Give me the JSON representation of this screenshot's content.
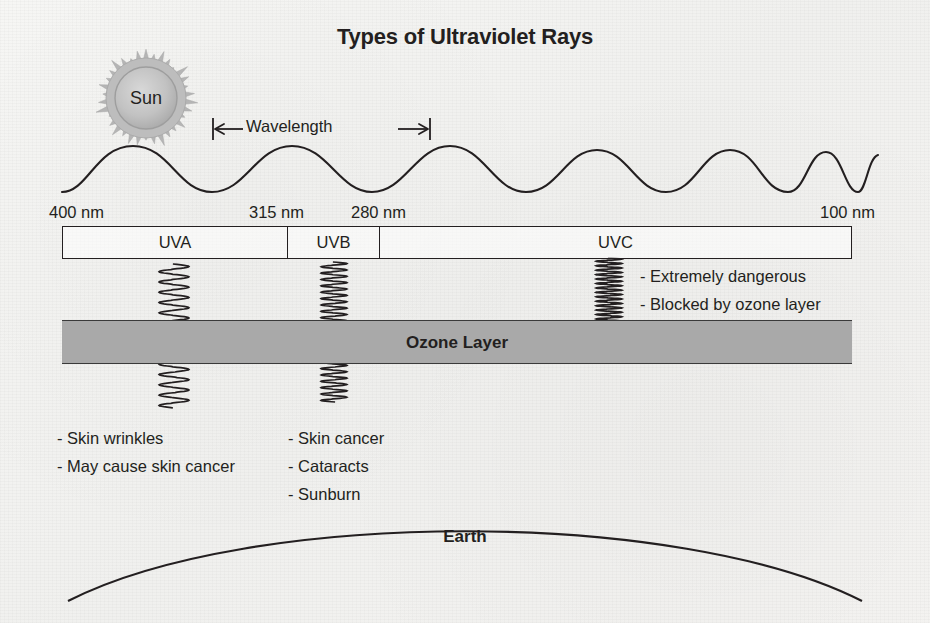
{
  "title": "Types of Ultraviolet Rays",
  "sun": {
    "label": "Sun",
    "icon": "sun-starburst-icon",
    "color": "#b3b3b3"
  },
  "wavelength_annotation": {
    "label": "Wavelength",
    "icon": "double-headed-arrow-icon"
  },
  "spectrum": {
    "tick_labels": [
      {
        "id": "left",
        "value": "400 nm"
      },
      {
        "id": "uva-uvb",
        "value": "315 nm"
      },
      {
        "id": "uvb-uvc",
        "value": "280 nm"
      },
      {
        "id": "right",
        "value": "100 nm"
      }
    ],
    "bands": [
      {
        "id": "uva",
        "label": "UVA"
      },
      {
        "id": "uvb",
        "label": "UVB"
      },
      {
        "id": "uvc",
        "label": "UVC"
      }
    ]
  },
  "ozone": {
    "label": "Ozone Layer",
    "fill_color": "#a9a9a9",
    "border_color": "#3a3a3a"
  },
  "rays": [
    {
      "id": "uva-ray",
      "band": "UVA",
      "blocked": false
    },
    {
      "id": "uvb-ray",
      "band": "UVB",
      "blocked": false
    },
    {
      "id": "uvc-ray",
      "band": "UVC",
      "blocked": true
    }
  ],
  "effects": {
    "uva": [
      "- Skin wrinkles",
      "- May cause skin cancer"
    ],
    "uvb": [
      "- Skin cancer",
      "- Cataracts",
      "- Sunburn"
    ],
    "uvc": [
      "- Extremely dangerous",
      "- Blocked by ozone layer"
    ]
  },
  "earth": {
    "label": "Earth"
  },
  "chart_data": {
    "type": "diagram",
    "title": "Types of Ultraviolet Rays",
    "axis": {
      "name": "wavelength",
      "unit": "nm",
      "start": 400,
      "end": 100,
      "direction": "decreasing-left-to-right",
      "labeled_ticks": [
        400,
        315,
        280,
        100
      ]
    },
    "categories": [
      "UVA",
      "UVB",
      "UVC"
    ],
    "series": [
      {
        "name": "wavelength range (nm)",
        "values": [
          {
            "band": "UVA",
            "from": 400,
            "to": 315
          },
          {
            "band": "UVB",
            "from": 315,
            "to": 280
          },
          {
            "band": "UVC",
            "from": 280,
            "to": 100
          }
        ]
      },
      {
        "name": "reaches earth surface",
        "values": [
          true,
          true,
          false
        ]
      }
    ],
    "annotations": [
      {
        "band": "UVA",
        "effects": [
          "- Skin wrinkles",
          "- May cause skin cancer"
        ]
      },
      {
        "band": "UVB",
        "effects": [
          "- Skin cancer",
          "- Cataracts",
          "- Sunburn"
        ]
      },
      {
        "band": "UVC",
        "effects": [
          "- Extremely dangerous",
          "- Blocked by ozone layer"
        ]
      }
    ],
    "legend": [
      "Sun",
      "Wavelength",
      "Ozone Layer",
      "Earth"
    ]
  }
}
